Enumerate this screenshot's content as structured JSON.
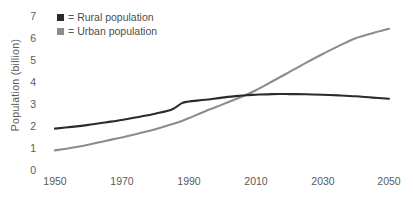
{
  "chart_data": {
    "type": "line",
    "title": "",
    "xlabel": "",
    "ylabel": "Population (billion)",
    "xlim": [
      1950,
      2050
    ],
    "ylim": [
      0,
      7
    ],
    "grid": false,
    "legend_position": "top-left-inside",
    "x_ticks": [
      "1950",
      "1970",
      "1990",
      "2010",
      "2030",
      "2050"
    ],
    "x_tick_values": [
      1950,
      1970,
      1990,
      2010,
      2030,
      2050
    ],
    "y_ticks": [
      "0",
      "1",
      "2",
      "3",
      "4",
      "5",
      "6",
      "7"
    ],
    "y_tick_values": [
      0,
      1,
      2,
      3,
      4,
      5,
      6,
      7
    ],
    "x": [
      1950,
      1955,
      1960,
      1965,
      1970,
      1975,
      1980,
      1985,
      1988,
      1990,
      1995,
      2000,
      2005,
      2007,
      2010,
      2015,
      2020,
      2025,
      2030,
      2035,
      2040,
      2045,
      2050
    ],
    "series": [
      {
        "name": "Rural population",
        "color": "#2b2b2b",
        "values": [
          1.79,
          1.87,
          1.96,
          2.07,
          2.18,
          2.32,
          2.47,
          2.66,
          2.95,
          3.02,
          3.1,
          3.2,
          3.28,
          3.31,
          3.33,
          3.36,
          3.36,
          3.35,
          3.33,
          3.3,
          3.26,
          3.2,
          3.15
        ]
      },
      {
        "name": "Urban population",
        "color": "#8c8c8c",
        "values": [
          0.8,
          0.92,
          1.06,
          1.23,
          1.39,
          1.57,
          1.76,
          1.99,
          2.14,
          2.26,
          2.58,
          2.88,
          3.18,
          3.31,
          3.52,
          3.93,
          4.35,
          4.77,
          5.17,
          5.55,
          5.9,
          6.13,
          6.33
        ]
      }
    ],
    "legend": [
      {
        "marker": "square",
        "separator": "=",
        "label": "Rural population",
        "color": "#2b2b2b"
      },
      {
        "marker": "square",
        "separator": "=",
        "label": "Urban population",
        "color": "#8c8c8c"
      }
    ]
  },
  "colors": {
    "background": "#ffffff",
    "text": "#5a5a5c",
    "rural": "#2b2b2b",
    "urban": "#8c8c8c"
  }
}
